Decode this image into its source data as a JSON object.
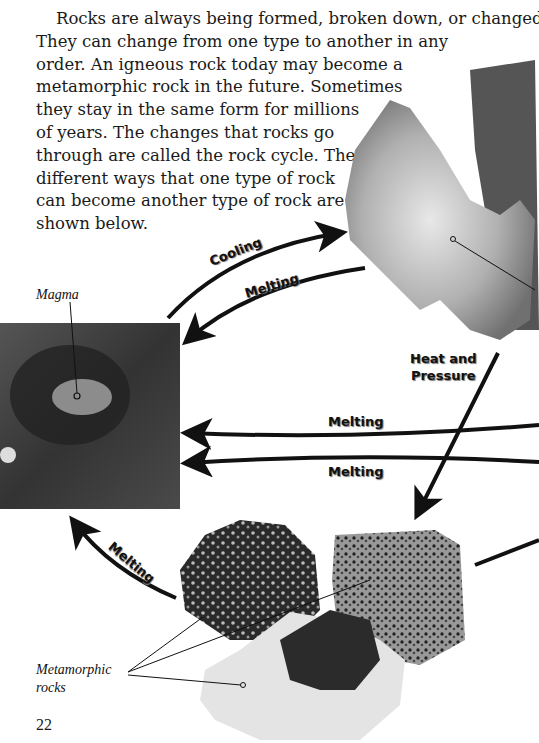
{
  "paragraph": {
    "lines": [
      "Rocks are always being formed, broken down, or changed.",
      "They can change from one type to another in any",
      "order. An igneous rock today may become a",
      "metamorphic rock in the future. Sometimes",
      "they stay in the same form for millions",
      "of years. The changes that rocks go",
      "through are called the rock cycle. The",
      "different ways that one type of rock",
      "can become another type of rock are",
      "shown below."
    ]
  },
  "diagram": {
    "arrow_labels": {
      "cooling": "Cooling",
      "melting_top": "Melting",
      "heat_pressure_1": "Heat and",
      "heat_pressure_2": "Pressure",
      "melting_mid1": "Melting",
      "melting_mid2": "Melting",
      "melting_bottom": "Melting"
    },
    "captions": {
      "magma": "Magma",
      "metamorphic_1": "Metamorphic",
      "metamorphic_2": "rocks"
    }
  },
  "page_number": "22"
}
